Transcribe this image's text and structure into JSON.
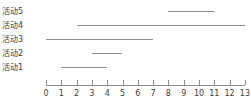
{
  "chart_data": {
    "type": "bar",
    "orientation": "horizontal",
    "subtype": "gantt",
    "title": "",
    "subtitle": "",
    "xlabel": "",
    "ylabel": "",
    "xlim": [
      0,
      13
    ],
    "ylim": [
      0,
      5
    ],
    "grid": false,
    "legend": null,
    "xticks": [
      0,
      1,
      2,
      3,
      4,
      5,
      6,
      7,
      8,
      9,
      10,
      11,
      12,
      13
    ],
    "xtick_labels": [
      "0",
      "1",
      "2",
      "3",
      "4",
      "5",
      "6",
      "7",
      "8",
      "9",
      "10",
      "11",
      "12",
      "13"
    ],
    "categories": [
      "活动5",
      "活动4",
      "活动3",
      "活动2",
      "活动1"
    ],
    "bars": [
      {
        "label": "活动5",
        "start": 8,
        "end": 11,
        "duration": 3
      },
      {
        "label": "活动4",
        "start": 2,
        "end": 13,
        "duration": 11
      },
      {
        "label": "活动3",
        "start": 0,
        "end": 7,
        "duration": 7
      },
      {
        "label": "活动2",
        "start": 3,
        "end": 5,
        "duration": 2
      },
      {
        "label": "活动1",
        "start": 1,
        "end": 4,
        "duration": 3
      }
    ],
    "series": [
      {
        "name": "start",
        "values": [
          8,
          2,
          0,
          3,
          1
        ]
      },
      {
        "name": "duration",
        "values": [
          3,
          11,
          7,
          2,
          3
        ]
      }
    ],
    "colors": {
      "bar": "#8d8d8d",
      "axis": "#8d8d8d",
      "text": "#3c3c3c",
      "background": "#ffffff"
    },
    "annotations": []
  },
  "geometry": {
    "x0_px": 46,
    "px_per_unit": 15.3,
    "axis_y_px": 85,
    "tick_len_px": 5,
    "row_y_px": [
      11,
      25,
      39,
      53,
      67
    ]
  }
}
